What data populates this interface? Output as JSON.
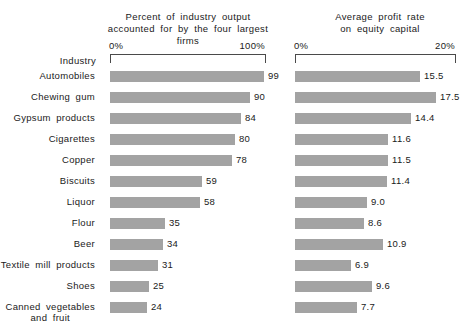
{
  "chart_data": {
    "type": "bar",
    "title": "",
    "orientation": "horizontal",
    "row_axis_label": "Industry",
    "categories": [
      "Automobiles",
      "Chewing gum",
      "Gypsum products",
      "Cigarettes",
      "Copper",
      "Biscuits",
      "Liquor",
      "Flour",
      "Beer",
      "Textile mill products",
      "Shoes",
      "Canned vegetables and fruit"
    ],
    "category_lines": [
      [
        "Automobiles"
      ],
      [
        "Chewing gum"
      ],
      [
        "Gypsum products"
      ],
      [
        "Cigarettes"
      ],
      [
        "Copper"
      ],
      [
        "Biscuits"
      ],
      [
        "Liquor"
      ],
      [
        "Flour"
      ],
      [
        "Beer"
      ],
      [
        "Textile mill products"
      ],
      [
        "Shoes"
      ],
      [
        "Canned vegetables",
        "and fruit"
      ]
    ],
    "panels": [
      {
        "id": "concentration",
        "title_lines": [
          "Percent of industry output",
          "accounted for by the four largest firms"
        ],
        "axis_min_label": "0%",
        "axis_max_label": "100%",
        "xlim": [
          0,
          100
        ],
        "values": [
          99,
          90,
          84,
          80,
          78,
          59,
          58,
          35,
          34,
          31,
          25,
          24
        ],
        "value_labels": [
          "99",
          "90",
          "84",
          "80",
          "78",
          "59",
          "58",
          "35",
          "34",
          "31",
          "25",
          "24"
        ]
      },
      {
        "id": "profit-rate",
        "title_lines": [
          "Average profit rate",
          "on equity capital"
        ],
        "axis_min_label": "0%",
        "axis_max_label": "20%",
        "xlim": [
          0,
          20
        ],
        "values": [
          15.5,
          17.5,
          14.4,
          11.6,
          11.5,
          11.4,
          9.0,
          8.6,
          10.9,
          6.9,
          9.6,
          7.7
        ],
        "value_labels": [
          "15.5",
          "17.5",
          "14.4",
          "11.6",
          "11.5",
          "11.4",
          "9.0",
          "8.6",
          "10.9",
          "6.9",
          "9.6",
          "7.7"
        ]
      }
    ],
    "grid": false,
    "legend": null,
    "bar_color": "#a3a3a3",
    "axis_color": "#4a4a4a",
    "text_color": "#1a1a1a"
  }
}
